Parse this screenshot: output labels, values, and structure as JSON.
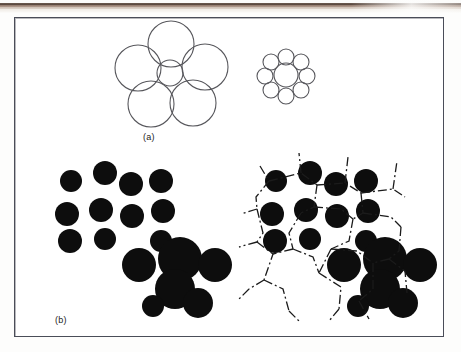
{
  "figure": {
    "caption_labels": {
      "panel_a": "(a)",
      "panel_b": "(b)"
    },
    "colors": {
      "circle_outline": "#57575c",
      "circle_fill_solid": "#0d0d0d",
      "frame_border": "#4a4d58",
      "page_background": "#fdfdfc",
      "scan_stripe_dark": "#56453c",
      "scan_stripe_tan": "#cbbdb2",
      "tessellation_line": "#1b1b1b"
    },
    "panel_a": {
      "name": "ebbinghaus-illusion",
      "left_cluster": {
        "center": {
          "cx": 169,
          "cy": 72,
          "r": 13
        },
        "surrounding_r": 23,
        "surrounding": [
          {
            "cx": 170,
            "cy": 43,
            "r": 23
          },
          {
            "cx": 204,
            "cy": 66,
            "r": 23
          },
          {
            "cx": 192,
            "cy": 102,
            "r": 23
          },
          {
            "cx": 150,
            "cy": 103,
            "r": 23
          },
          {
            "cx": 137,
            "cy": 67,
            "r": 23
          }
        ]
      },
      "right_cluster": {
        "center": {
          "cx": 285,
          "cy": 74,
          "r": 12
        },
        "surrounding_r": 8,
        "surrounding": [
          {
            "cx": 285,
            "cy": 56,
            "r": 8
          },
          {
            "cx": 300,
            "cy": 61,
            "r": 8
          },
          {
            "cx": 306,
            "cy": 75,
            "r": 8
          },
          {
            "cx": 300,
            "cy": 89,
            "r": 8
          },
          {
            "cx": 285,
            "cy": 95,
            "r": 8
          },
          {
            "cx": 270,
            "cy": 89,
            "r": 8
          },
          {
            "cx": 264,
            "cy": 75,
            "r": 8
          },
          {
            "cx": 270,
            "cy": 61,
            "r": 8
          }
        ]
      }
    },
    "panel_b": {
      "name": "particle-packing-and-dirichlet-tessellation",
      "left_cluster_offset": {
        "x": 0,
        "y": 0
      },
      "right_cluster_offset": {
        "x": 205,
        "y": 0
      },
      "circles": [
        {
          "cx": 70,
          "cy": 180,
          "r": 11
        },
        {
          "cx": 104,
          "cy": 172,
          "r": 12
        },
        {
          "cx": 130,
          "cy": 183,
          "r": 12
        },
        {
          "cx": 160,
          "cy": 180,
          "r": 12
        },
        {
          "cx": 66,
          "cy": 213,
          "r": 12
        },
        {
          "cx": 100,
          "cy": 209,
          "r": 12
        },
        {
          "cx": 131,
          "cy": 215,
          "r": 12
        },
        {
          "cx": 162,
          "cy": 210,
          "r": 12
        },
        {
          "cx": 69,
          "cy": 240,
          "r": 12
        },
        {
          "cx": 104,
          "cy": 238,
          "r": 11
        },
        {
          "cx": 160,
          "cy": 240,
          "r": 11
        },
        {
          "cx": 138,
          "cy": 264,
          "r": 17
        },
        {
          "cx": 179,
          "cy": 258,
          "r": 22
        },
        {
          "cx": 174,
          "cy": 288,
          "r": 20
        },
        {
          "cx": 214,
          "cy": 264,
          "r": 17
        },
        {
          "cx": 152,
          "cy": 305,
          "r": 11
        },
        {
          "cx": 197,
          "cy": 302,
          "r": 15
        }
      ],
      "tessellation_lines": [
        [
          [
            259,
            165
          ],
          [
            268,
            180
          ],
          [
            255,
            196
          ],
          [
            256,
            208
          ]
        ],
        [
          [
            256,
            208
          ],
          [
            240,
            213
          ]
        ],
        [
          [
            256,
            208
          ],
          [
            262,
            232
          ],
          [
            256,
            241
          ]
        ],
        [
          [
            256,
            241
          ],
          [
            238,
            246
          ]
        ],
        [
          [
            256,
            241
          ],
          [
            272,
            253
          ],
          [
            263,
            279
          ]
        ],
        [
          [
            263,
            279
          ],
          [
            248,
            288
          ]
        ],
        [
          [
            263,
            279
          ],
          [
            282,
            288
          ],
          [
            288,
            310
          ]
        ],
        [
          [
            268,
            180
          ],
          [
            300,
            172
          ],
          [
            316,
            184
          ]
        ],
        [
          [
            300,
            172
          ],
          [
            298,
            152
          ]
        ],
        [
          [
            316,
            184
          ],
          [
            313,
            206
          ],
          [
            300,
            212
          ]
        ],
        [
          [
            316,
            184
          ],
          [
            344,
            182
          ],
          [
            360,
            192
          ]
        ],
        [
          [
            344,
            182
          ],
          [
            347,
            156
          ]
        ],
        [
          [
            313,
            206
          ],
          [
            340,
            208
          ],
          [
            352,
            218
          ]
        ],
        [
          [
            360,
            192
          ],
          [
            362,
            212
          ],
          [
            352,
            218
          ]
        ],
        [
          [
            360,
            192
          ],
          [
            392,
            188
          ],
          [
            404,
            196
          ]
        ],
        [
          [
            392,
            188
          ],
          [
            396,
            160
          ]
        ],
        [
          [
            352,
            218
          ],
          [
            348,
            240
          ],
          [
            330,
            248
          ]
        ],
        [
          [
            362,
            212
          ],
          [
            390,
            216
          ],
          [
            400,
            226
          ]
        ],
        [
          [
            300,
            212
          ],
          [
            288,
            232
          ],
          [
            292,
            248
          ]
        ],
        [
          [
            292,
            248
          ],
          [
            272,
            253
          ]
        ],
        [
          [
            292,
            248
          ],
          [
            312,
            256
          ],
          [
            318,
            272
          ]
        ],
        [
          [
            330,
            248
          ],
          [
            318,
            272
          ]
        ],
        [
          [
            318,
            272
          ],
          [
            340,
            286
          ],
          [
            338,
            308
          ]
        ],
        [
          [
            330,
            248
          ],
          [
            356,
            250
          ],
          [
            372,
            262
          ]
        ],
        [
          [
            372,
            262
          ],
          [
            372,
            288
          ],
          [
            358,
            300
          ]
        ],
        [
          [
            400,
            226
          ],
          [
            398,
            250
          ],
          [
            388,
            258
          ]
        ],
        [
          [
            388,
            258
          ],
          [
            372,
            262
          ]
        ],
        [
          [
            388,
            258
          ],
          [
            404,
            270
          ],
          [
            406,
            292
          ]
        ],
        [
          [
            338,
            308
          ],
          [
            328,
            320
          ]
        ],
        [
          [
            288,
            310
          ],
          [
            300,
            322
          ]
        ],
        [
          [
            358,
            300
          ],
          [
            368,
            318
          ]
        ],
        [
          [
            248,
            288
          ],
          [
            236,
            300
          ]
        ]
      ]
    }
  }
}
